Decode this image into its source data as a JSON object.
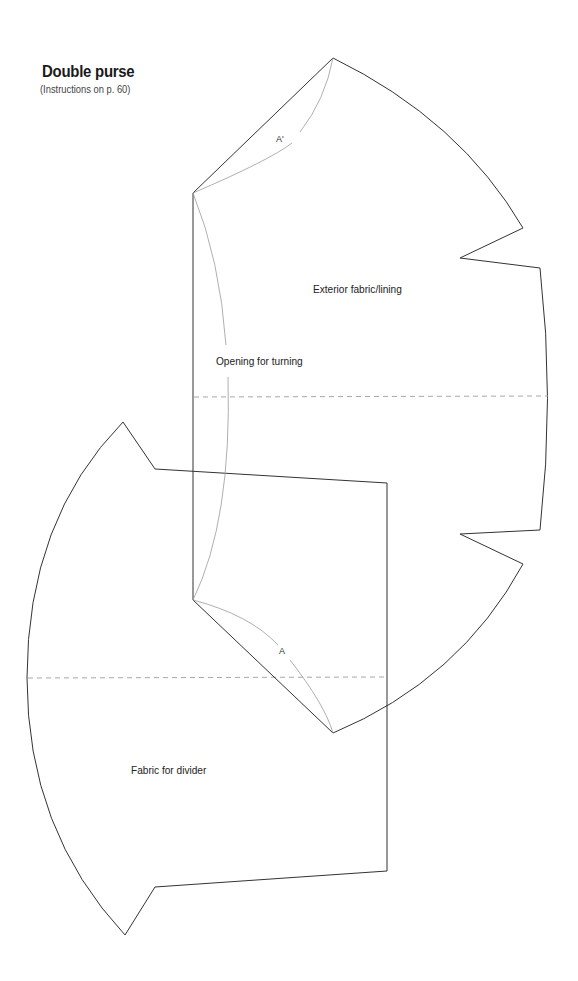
{
  "header": {
    "title": "Double purse",
    "subtitle": "(Instructions on p. 60)"
  },
  "pieces": {
    "exterior": {
      "label": "Exterior fabric/lining",
      "opening_label": "Opening for turning",
      "mark_top": "A'",
      "mark_bottom": "A"
    },
    "divider": {
      "label": "Fabric for divider"
    }
  },
  "style": {
    "outline_color": "#333333",
    "guide_color": "#9a9a9a",
    "fold_line_color": "#a8a8a8"
  }
}
